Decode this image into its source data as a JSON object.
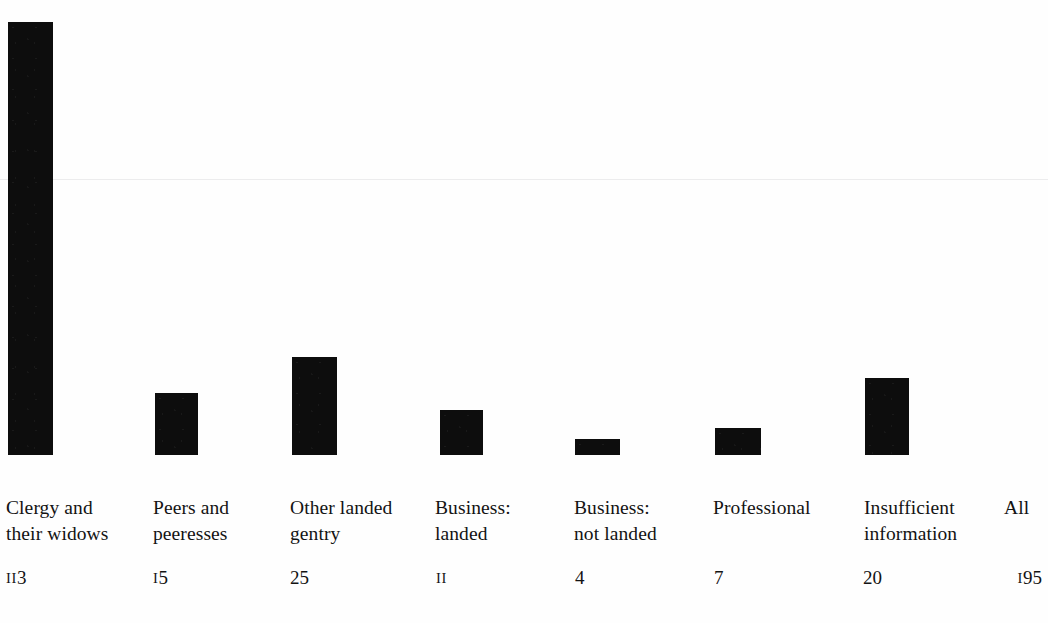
{
  "figure": {
    "background_color": "#fefefe",
    "bar_color": "#0d0d0d",
    "fold_line_color": "#ececed",
    "fold_line_y": 179
  },
  "chart_data": {
    "type": "bar",
    "title": "",
    "subtitle": "",
    "xlabel": "",
    "ylabel": "",
    "grid": false,
    "legend": null,
    "categories": [
      "Clergy and\ntheir widows",
      "Peers and\npeeresses",
      "Other landed\ngentry",
      "Business:\nlanded",
      "Business:\nnot landed",
      "Professional",
      "Insufficient\ninformation",
      "All"
    ],
    "values": [
      113,
      15,
      25,
      11,
      4,
      7,
      20,
      195
    ],
    "value_labels": [
      "113",
      "15",
      "25",
      "11",
      "4",
      "7",
      "20",
      "195"
    ],
    "has_bar": [
      true,
      true,
      true,
      true,
      true,
      true,
      true,
      false
    ],
    "ylim": [
      0,
      113
    ],
    "note": "Final category 'All' is a total column and is drawn without a bar."
  },
  "columns": [
    {
      "label": "Clergy and\ntheir widows",
      "value": 113,
      "value_label": "113",
      "x": 6,
      "bar_x": 8,
      "bar_w": 45,
      "bar_h": 433,
      "has_bar": true,
      "value_x": 6,
      "align": "left"
    },
    {
      "label": "Peers and\npeeresses",
      "value": 15,
      "value_label": "15",
      "x": 153,
      "bar_x": 155,
      "bar_w": 43,
      "bar_h": 62,
      "has_bar": true,
      "value_x": 153,
      "align": "left"
    },
    {
      "label": "Other landed\ngentry",
      "value": 25,
      "value_label": "25",
      "x": 290,
      "bar_x": 292,
      "bar_w": 45,
      "bar_h": 98,
      "has_bar": true,
      "value_x": 290,
      "align": "left"
    },
    {
      "label": "Business:\nlanded",
      "value": 11,
      "value_label": "11",
      "x": 435,
      "bar_x": 440,
      "bar_w": 43,
      "bar_h": 45,
      "has_bar": true,
      "value_x": 436,
      "align": "left"
    },
    {
      "label": "Business:\nnot landed",
      "value": 4,
      "value_label": "4",
      "x": 574,
      "bar_x": 575,
      "bar_w": 45,
      "bar_h": 16,
      "has_bar": true,
      "value_x": 575,
      "align": "left"
    },
    {
      "label": "Professional",
      "value": 7,
      "value_label": "7",
      "x": 713,
      "bar_x": 715,
      "bar_w": 46,
      "bar_h": 27,
      "has_bar": true,
      "value_x": 714,
      "align": "left"
    },
    {
      "label": "Insufficient\ninformation",
      "value": 20,
      "value_label": "20",
      "x": 864,
      "bar_x": 865,
      "bar_w": 44,
      "bar_h": 77,
      "has_bar": true,
      "value_x": 863,
      "align": "left"
    },
    {
      "label": "All",
      "value": 195,
      "value_label": "195",
      "x": 1004,
      "bar_x": 0,
      "bar_w": 0,
      "bar_h": 0,
      "has_bar": false,
      "value_x": 1042,
      "align": "right"
    }
  ]
}
